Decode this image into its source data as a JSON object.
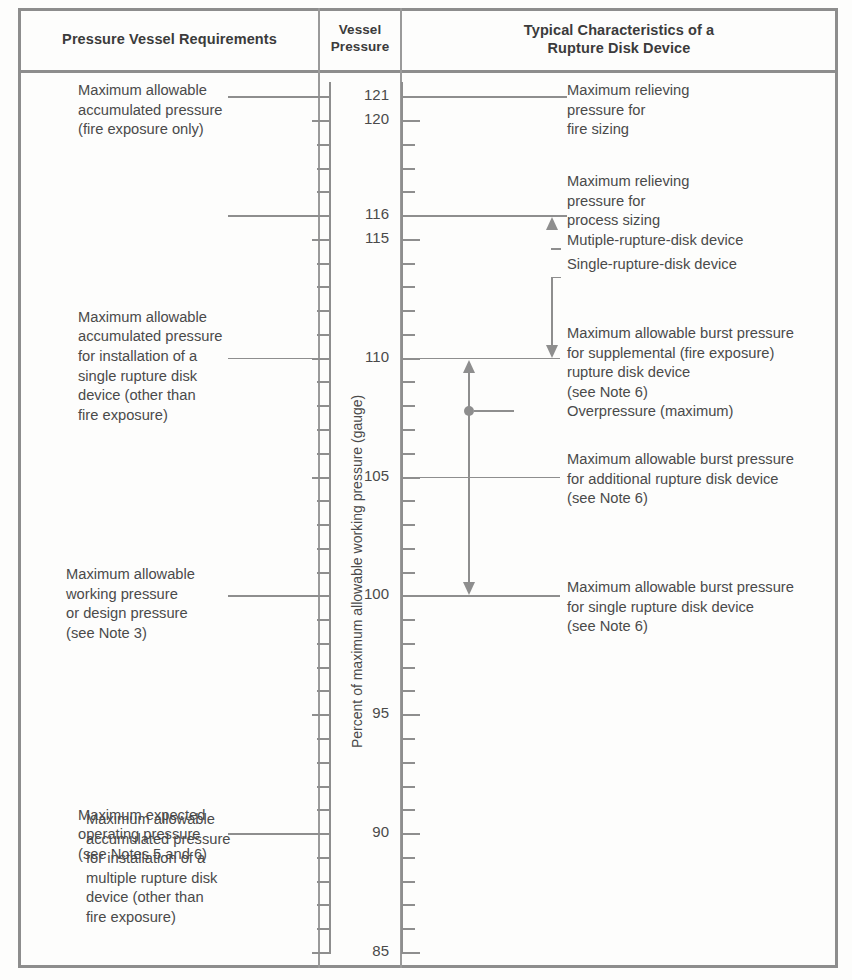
{
  "figure": {
    "headers": {
      "col1": "Pressure Vessel Requirements",
      "col2_line1": "Vessel",
      "col2_line2": "Pressure",
      "col3_line1": "Typical Characteristics of a",
      "col3_line2": "Rupture Disk Device"
    },
    "axis_label": "Percent of maximum allowable working pressure (gauge)",
    "axis": {
      "min": 85,
      "max": 121.6,
      "labeled_ticks": [
        121,
        120,
        116,
        115,
        110,
        105,
        100,
        95,
        90,
        85
      ],
      "minor_tick_step": 1,
      "units": "percent of MAWP (gauge)"
    },
    "left_labels": [
      {
        "value": 121,
        "lines": [
          "Maximum allowable",
          "accumulated pressure",
          "(fire exposure only)"
        ]
      },
      {
        "value": 116,
        "lines": [
          "Maximum allowable",
          "accumulated pressure",
          "for installation of a",
          "multiple rupture disk",
          "device (other than",
          "fire exposure)"
        ]
      },
      {
        "value": 110,
        "lines": [
          "Maximum allowable",
          "accumulated pressure",
          "for installation of a",
          "single rupture disk",
          "device (other than",
          "fire exposure)"
        ]
      },
      {
        "value": 100,
        "lines": [
          "Maximum allowable",
          "working pressure",
          "or design pressure",
          "(see Note 3)"
        ]
      },
      {
        "value": 90,
        "lines": [
          "Maximum expected",
          "operating pressure",
          "(see Notes 5 and 6)"
        ]
      }
    ],
    "right_labels": [
      {
        "value": 121,
        "lines": [
          "Maximum relieving",
          "pressure for",
          "fire sizing"
        ]
      },
      {
        "value": 116,
        "lines": [
          "Maximum relieving",
          "pressure for",
          "process sizing"
        ]
      },
      {
        "value": 114.6,
        "lines": [
          "Mutiple-rupture-disk device"
        ]
      },
      {
        "value": 113.4,
        "lines": [
          "Single-rupture-disk device"
        ]
      },
      {
        "value": 110,
        "lines": [
          "Maximum allowable burst pressure",
          "for supplemental (fire exposure)",
          "rupture disk device",
          "(see Note 6)"
        ]
      },
      {
        "value": 107.8,
        "lines": [
          "Overpressure (maximum)"
        ]
      },
      {
        "value": 105,
        "lines": [
          "Maximum allowable burst pressure",
          "for additional rupture disk device",
          "(see Note 6)"
        ]
      },
      {
        "value": 100,
        "lines": [
          "Maximum allowable burst pressure",
          "for single rupture disk device",
          "(see Note 6)"
        ]
      }
    ],
    "annotations": {
      "multiple_disk_arrow": {
        "from": 114.6,
        "to": 116,
        "direction": "up"
      },
      "supplemental_arrow": {
        "from": 113.4,
        "to": 110,
        "direction": "down"
      },
      "overpressure_up_arrow": {
        "from": 105,
        "to": 110,
        "direction": "up"
      },
      "single_disk_arrow": {
        "from": 105,
        "to": 100,
        "direction": "down"
      }
    },
    "colors": {
      "ink": "#4a4a4a",
      "rule": "#8e8e8e",
      "frame": "#8d8d8d",
      "background": "#fdfdfc"
    }
  }
}
